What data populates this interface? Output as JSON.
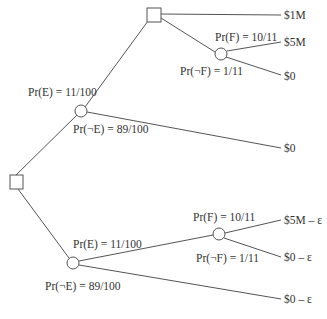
{
  "diagram": {
    "type": "decision-tree",
    "nodes": {
      "root": {
        "kind": "decision"
      },
      "upper_chance_E": {
        "kind": "chance"
      },
      "upper_decision": {
        "kind": "decision"
      },
      "upper_chance_F": {
        "kind": "chance"
      },
      "lower_chance_E": {
        "kind": "chance"
      },
      "lower_chance_F": {
        "kind": "chance"
      }
    },
    "labels": {
      "upper_pr_e": "Pr(E) = 11/100",
      "upper_pr_not_e": "Pr(¬E) = 89/100",
      "upper_pr_f": "Pr(F) = 10/11",
      "upper_pr_not_f": "Pr(¬F) = 1/11",
      "lower_pr_e": "Pr(E) = 11/100",
      "lower_pr_not_e": "Pr(¬E) = 89/100",
      "lower_pr_f": "Pr(F) = 10/11",
      "lower_pr_not_f": "Pr(¬F) = 1/11"
    },
    "outcomes": [
      "$1M",
      "$5M",
      "$0",
      "$0",
      "$5M – ε",
      "$0 – ε",
      "$0 – ε"
    ]
  }
}
